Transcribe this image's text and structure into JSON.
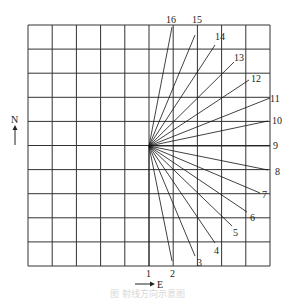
{
  "diagram": {
    "grid": {
      "x0": 28,
      "y0": 25,
      "x1": 270,
      "y1": 266,
      "cols": 10,
      "rows": 10,
      "color": "#333333"
    },
    "origin": {
      "x": 149,
      "y": 146
    },
    "rays": [
      {
        "label": "1",
        "x": 149,
        "y": 266,
        "lx": 146,
        "ly": 277
      },
      {
        "label": "2",
        "x": 172,
        "y": 261,
        "lx": 170,
        "ly": 277
      },
      {
        "label": "3",
        "x": 195,
        "y": 256,
        "lx": 197,
        "ly": 266
      },
      {
        "label": "4",
        "x": 215,
        "y": 243,
        "lx": 214,
        "ly": 254
      },
      {
        "label": "5",
        "x": 232,
        "y": 226,
        "lx": 233,
        "ly": 236
      },
      {
        "label": "6",
        "x": 247,
        "y": 212,
        "lx": 250,
        "ly": 221
      },
      {
        "label": "7",
        "x": 260,
        "y": 193,
        "lx": 262,
        "ly": 198
      },
      {
        "label": "8",
        "x": 268,
        "y": 170,
        "lx": 275,
        "ly": 175
      },
      {
        "label": "9",
        "x": 270,
        "y": 146,
        "lx": 273,
        "ly": 149
      },
      {
        "label": "10",
        "x": 268,
        "y": 121,
        "lx": 272,
        "ly": 124
      },
      {
        "label": "11",
        "x": 270,
        "y": 98,
        "lx": 270,
        "ly": 102
      },
      {
        "label": "12",
        "x": 249,
        "y": 80,
        "lx": 251,
        "ly": 82
      },
      {
        "label": "13",
        "x": 234,
        "y": 62,
        "lx": 234,
        "ly": 61
      },
      {
        "label": "14",
        "x": 215,
        "y": 45,
        "lx": 215,
        "ly": 40
      },
      {
        "label": "15",
        "x": 195,
        "y": 35,
        "lx": 192,
        "ly": 23
      },
      {
        "label": "16",
        "x": 172,
        "y": 27,
        "lx": 166,
        "ly": 23
      }
    ],
    "north_label": "N",
    "east_label": "E"
  },
  "caption": "图 射线方向示意图"
}
